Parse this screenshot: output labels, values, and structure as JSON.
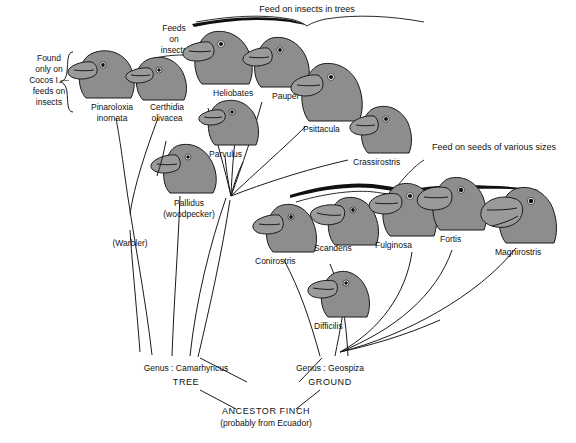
{
  "figure": {
    "background_color": "#ffffff",
    "head_fill_color": "#8d8d8d",
    "line_color": "#1a1a1a"
  },
  "annotations": {
    "top_bracket": "Feed on insects in trees",
    "left_bracket": "Found\nonly on\nCocos I.—\nfeeds on\ninsects",
    "left_bracket_lines": [
      "Found",
      "only on",
      "Cocos I.—",
      "feeds on",
      "insects"
    ],
    "feeds_on_insects_lines": [
      "Feeds",
      "on",
      "insects"
    ],
    "seeds_bracket": "Feed on seeds of various sizes"
  },
  "birds": [
    {
      "id": "pinaroloxia",
      "name_lines": [
        "Pinaroloxia",
        "inornata"
      ],
      "beak": "medium-pointed"
    },
    {
      "id": "certhidia",
      "name_lines": [
        "Certhidia",
        "olivacea"
      ],
      "beak": "slender-warbler"
    },
    {
      "id": "heliobates",
      "name_lines": [
        "Heliobates"
      ],
      "beak": "medium"
    },
    {
      "id": "pauper",
      "name_lines": [
        "Pauper"
      ],
      "beak": "medium"
    },
    {
      "id": "parvulus",
      "name_lines": [
        "Parvulus"
      ],
      "beak": "small"
    },
    {
      "id": "psittacula",
      "name_lines": [
        "Psittacula"
      ],
      "beak": "parrot-like"
    },
    {
      "id": "crassirostris",
      "name_lines": [
        "Crassirostris"
      ],
      "beak": "thick"
    },
    {
      "id": "pallidus",
      "name_lines": [
        "Pallidus",
        "(woodpecker)"
      ],
      "beak": "tool-using"
    },
    {
      "id": "conirostris",
      "name_lines": [
        "Conirostris"
      ],
      "beak": "cone"
    },
    {
      "id": "scandens",
      "name_lines": [
        "Scandens"
      ],
      "beak": "long-pointed"
    },
    {
      "id": "difficilis",
      "name_lines": [
        "Difficilis"
      ],
      "beak": "small-sharp"
    },
    {
      "id": "fulginosa",
      "name_lines": [
        "Fulginosa"
      ],
      "beak": "medium-seed"
    },
    {
      "id": "fortis",
      "name_lines": [
        "Fortis"
      ],
      "beak": "large-seed"
    },
    {
      "id": "magnirostris",
      "name_lines": [
        "Magnirostris"
      ],
      "beak": "very-large"
    }
  ],
  "branch_labels": {
    "warbler": "(Warbler)"
  },
  "genera": {
    "tree": {
      "genus": "Genus : Camarhyncus",
      "habit": "TREE"
    },
    "ground": {
      "genus": "Genus : Geospiza",
      "habit": "GROUND"
    }
  },
  "ancestor": {
    "line1": "ANCESTOR  FINCH",
    "line2": "(probably from Ecuador)"
  }
}
